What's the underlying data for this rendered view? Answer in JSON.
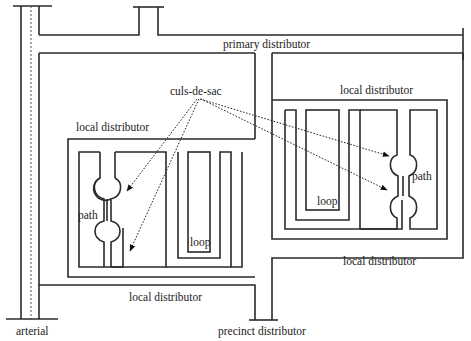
{
  "diagram": {
    "labels": {
      "primary_distributor": "primary distributor",
      "culs_de_sac": "culs-de-sac",
      "local_distributor_nw": "local distributor",
      "local_distributor_ne": "local distributor",
      "local_distributor_sw": "local distributor",
      "local_distributor_se": "local distributor",
      "path_left": "path",
      "path_right": "path",
      "loop_left": "loop",
      "loop_right": "loop",
      "arterial": "arterial",
      "precinct_distributor": "precinct distributor"
    },
    "colors": {
      "line": "#2a2a2a",
      "background": "#ffffff"
    }
  }
}
